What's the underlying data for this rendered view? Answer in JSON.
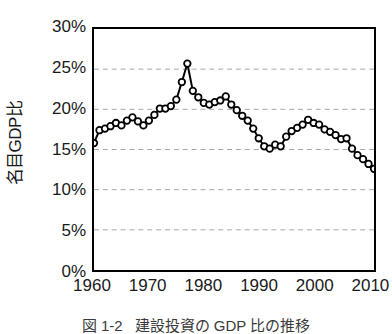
{
  "figure": {
    "caption_number": "図 1-2",
    "caption_text": "建設投資の GDP 比の推移"
  },
  "chart_data": {
    "type": "line",
    "title": "",
    "xlabel": "",
    "ylabel": "名目GDP比",
    "xlim": [
      1960,
      2011
    ],
    "ylim": [
      0,
      30
    ],
    "grid": true,
    "grid_axis": "y",
    "grid_style": "dashed",
    "grid_color": "#a6a6a6",
    "legend": false,
    "marker": "open-circle",
    "line_color": "#000000",
    "marker_face_color": "#ffffff",
    "marker_edge_color": "#000000",
    "y_ticks": [
      0,
      5,
      10,
      15,
      20,
      25,
      30
    ],
    "y_tick_labels": [
      "0%",
      "5%",
      "10%",
      "15%",
      "20%",
      "25%",
      "30%"
    ],
    "x_ticks": [
      1960,
      1970,
      1980,
      1990,
      2000,
      2010
    ],
    "x_tick_labels": [
      "1960",
      "1970",
      "1980",
      "1990",
      "2000",
      "2010"
    ],
    "series": [
      {
        "name": "建設投資の名目GDP比",
        "x": [
          1960,
          1961,
          1962,
          1963,
          1964,
          1965,
          1966,
          1967,
          1968,
          1969,
          1970,
          1971,
          1972,
          1973,
          1974,
          1975,
          1976,
          1977,
          1978,
          1979,
          1980,
          1981,
          1982,
          1983,
          1984,
          1985,
          1986,
          1987,
          1988,
          1989,
          1990,
          1991,
          1992,
          1993,
          1994,
          1995,
          1996,
          1997,
          1998,
          1999,
          2000,
          2001,
          2002,
          2003,
          2004,
          2005,
          2006,
          2007,
          2008,
          2009,
          2010,
          2011
        ],
        "values": [
          15.8,
          17.4,
          17.6,
          17.9,
          18.3,
          18.0,
          18.6,
          19.0,
          18.5,
          18.0,
          18.6,
          19.3,
          20.1,
          20.1,
          20.4,
          21.2,
          23.4,
          25.7,
          22.3,
          21.5,
          20.8,
          20.6,
          20.9,
          21.1,
          21.6,
          20.6,
          19.9,
          19.2,
          18.6,
          17.6,
          16.4,
          15.4,
          15.1,
          15.6,
          15.4,
          16.6,
          17.3,
          17.7,
          18.1,
          18.7,
          18.3,
          18.1,
          17.5,
          17.2,
          16.8,
          16.3,
          16.4,
          15.1,
          14.3,
          13.8,
          13.2,
          12.6
        ]
      }
    ]
  }
}
